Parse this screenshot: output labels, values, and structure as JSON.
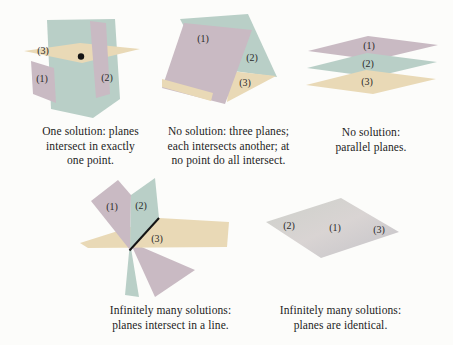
{
  "page": {
    "background": "#fcfcfa"
  },
  "colors": {
    "plane_pink": "#c9bac3",
    "plane_teal": "#b9cfc7",
    "plane_tan": "#e9d9b6",
    "identical_a": "#cdd0ca",
    "identical_b": "#d9d4d3",
    "identical_c": "#c4c3c8",
    "ink": "#141414",
    "text": "#1d1d1d"
  },
  "figures": [
    {
      "id": "one-solution",
      "labels": {
        "p1": "(1)",
        "p2": "(2)",
        "p3": "(3)"
      },
      "caption_lines": [
        "One solution: planes",
        "intersect in exactly",
        "one point."
      ]
    },
    {
      "id": "no-solution-each-intersects",
      "labels": {
        "p1": "(1)",
        "p2": "(2)",
        "p3": "(3)"
      },
      "caption_lines": [
        "No solution: three planes;",
        "each intersects another; at",
        "no point do all intersect."
      ]
    },
    {
      "id": "no-solution-parallel",
      "labels": {
        "p1": "(1)",
        "p2": "(2)",
        "p3": "(3)"
      },
      "caption_lines": [
        "No solution:",
        "parallel planes."
      ]
    },
    {
      "id": "infinite-solutions-line",
      "labels": {
        "p1": "(1)",
        "p2": "(2)",
        "p3": "(3)"
      },
      "caption_lines": [
        "Infinitely many solutions:",
        "planes intersect in a line."
      ]
    },
    {
      "id": "infinite-solutions-identical",
      "labels": {
        "p1": "(1)",
        "p2": "(2)",
        "p3": "(3)"
      },
      "caption_lines": [
        "Infinitely many solutions:",
        "planes are identical."
      ]
    }
  ]
}
